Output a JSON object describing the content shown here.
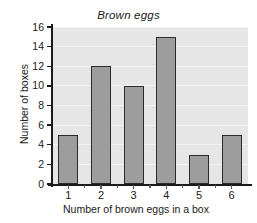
{
  "chart_data": {
    "type": "bar",
    "title": "Brown eggs",
    "xlabel": "Number of brown eggs in a box",
    "ylabel": "Number of boxes",
    "categories": [
      "1",
      "2",
      "3",
      "4",
      "5",
      "6"
    ],
    "values": [
      5,
      12,
      10,
      15,
      3,
      5
    ],
    "ylim": [
      0,
      16
    ],
    "ytick_labels": [
      "0",
      "2",
      "4",
      "6",
      "8",
      "10",
      "12",
      "14",
      "16"
    ],
    "ytick_values": [
      0,
      2,
      4,
      6,
      8,
      10,
      12,
      14,
      16
    ],
    "grid": true,
    "legend": false,
    "colors": {
      "bar_fill": "#9d9d9d",
      "bar_stroke": "#2b2b2b",
      "plot_background": "#e6e6e6",
      "gridline": "#f2f2f2",
      "axis": "#1a1a1a",
      "figure_background": "#ffffff"
    }
  }
}
